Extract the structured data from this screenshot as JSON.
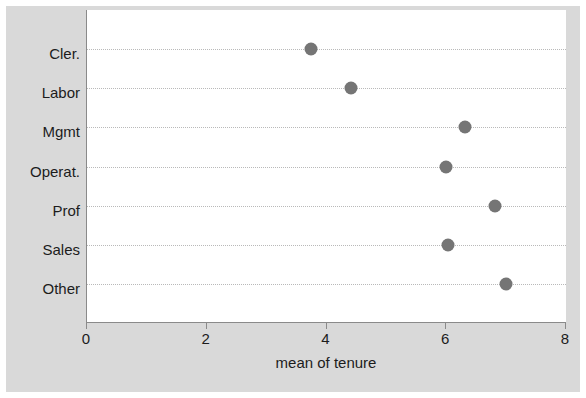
{
  "chart_data": {
    "type": "scatter",
    "title": "",
    "xlabel": "mean of tenure",
    "ylabel": "",
    "categories": [
      "Cler.",
      "Labor",
      "Mgmt",
      "Operat.",
      "Prof",
      "Sales",
      "Other"
    ],
    "values": [
      3.74,
      4.41,
      6.31,
      6.0,
      6.82,
      6.03,
      6.99
    ],
    "series": [
      {
        "name": "mean of tenure",
        "values": [
          3.74,
          4.41,
          6.31,
          6.0,
          6.82,
          6.03,
          6.99
        ]
      }
    ],
    "xlim": [
      0,
      8
    ],
    "xticks": [
      0,
      2,
      4,
      6,
      8
    ],
    "xticklabels": [
      "0",
      "2",
      "4",
      "6",
      "8"
    ],
    "grid": "horizontal-dotted",
    "legend": "none",
    "marker": "filled-circle",
    "marker_color": "#757575",
    "plot_background": "#ffffff",
    "figure_background": "#d9d9d9",
    "axis_color": "#8a8a8a",
    "gridline_color": "#b9b9b9",
    "text_color": "#1c1c1c"
  }
}
